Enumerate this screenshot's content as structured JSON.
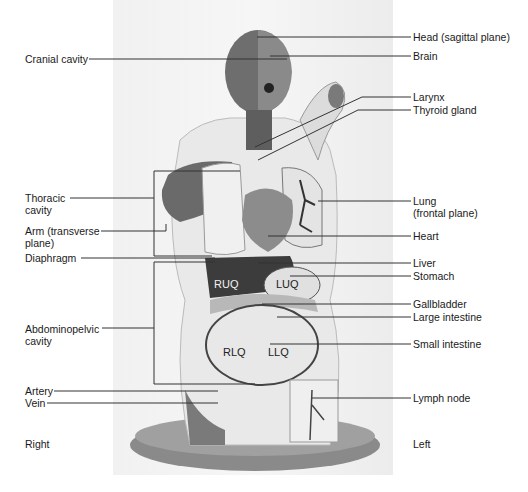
{
  "figure": {
    "orientation": {
      "left_side_label": "Right",
      "right_side_label": "Left"
    }
  },
  "labels_left": [
    {
      "id": "cranial",
      "text": "Cranial cavity"
    },
    {
      "id": "thoracic",
      "line1": "Thoracic",
      "line2": "cavity"
    },
    {
      "id": "arm",
      "line1": "Arm (transverse",
      "line2": "plane)"
    },
    {
      "id": "diaphragm",
      "text": "Diaphragm"
    },
    {
      "id": "abdominopelvic",
      "line1": "Abdominopelvic",
      "line2": "cavity"
    },
    {
      "id": "artery",
      "text": "Artery"
    },
    {
      "id": "vein",
      "text": "Vein"
    }
  ],
  "labels_right": [
    {
      "id": "head",
      "text": "Head (sagittal plane)"
    },
    {
      "id": "brain",
      "text": "Brain"
    },
    {
      "id": "larynx",
      "text": "Larynx"
    },
    {
      "id": "thyroid",
      "text": "Thyroid gland"
    },
    {
      "id": "lung",
      "line1": "Lung",
      "line2": "(frontal plane)"
    },
    {
      "id": "heart",
      "text": "Heart"
    },
    {
      "id": "liver",
      "text": "Liver"
    },
    {
      "id": "stomach",
      "text": "Stomach"
    },
    {
      "id": "gallbladder",
      "text": "Gallbladder"
    },
    {
      "id": "large-intestine",
      "text": "Large intestine"
    },
    {
      "id": "small-intestine",
      "text": "Small intestine"
    },
    {
      "id": "lymph",
      "text": "Lymph node"
    }
  ],
  "quadrants": [
    "RUQ",
    "LUQ",
    "RLQ",
    "LLQ"
  ],
  "colors": {
    "muscle": "#5a5a5a",
    "organ_light": "#e6e6e6",
    "liver": "#3c3c3c",
    "base": "#8a8a8a",
    "leader": "#333333"
  }
}
